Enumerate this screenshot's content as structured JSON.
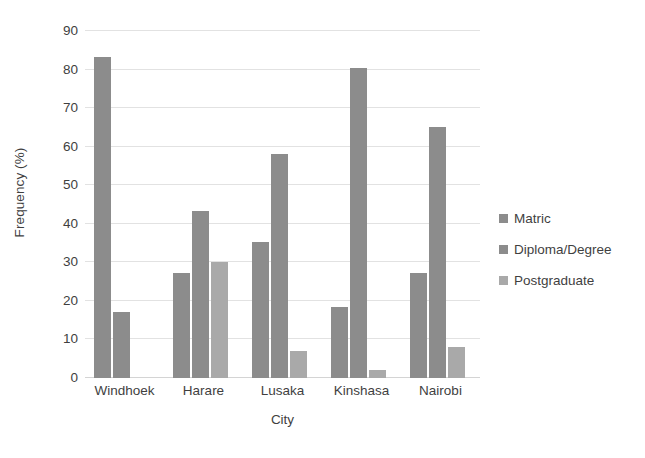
{
  "chart_data": {
    "type": "bar",
    "title": "",
    "xlabel": "City",
    "ylabel": "Frequency (%)",
    "categories": [
      "Windhoek",
      "Harare",
      "Lusaka",
      "Kinshasa",
      "Nairobi"
    ],
    "series": [
      {
        "name": "Matric",
        "color": "#8c8c8c",
        "values": [
          83.3,
          27.2,
          35.2,
          18.3,
          27.2
        ]
      },
      {
        "name": "Diploma/Degree",
        "color": "#8c8c8c",
        "values": [
          17.0,
          43.2,
          58.2,
          80.4,
          65.1
        ]
      },
      {
        "name": "Postgraduate",
        "color": "#a9a9a9",
        "values": [
          0,
          30.2,
          7.1,
          2.2,
          8.1
        ]
      }
    ],
    "ylim": [
      0,
      90
    ],
    "y_ticks": [
      0,
      10,
      20,
      30,
      40,
      50,
      60,
      70,
      80,
      90
    ],
    "y_tick_labels": [
      "0",
      "10",
      "20",
      "30",
      "40",
      "50",
      "60",
      "70",
      "80",
      "90"
    ],
    "grid": true,
    "legend_position": "right",
    "gridline_color": "#e2e2e2",
    "text_color": "#3f3f3f"
  }
}
